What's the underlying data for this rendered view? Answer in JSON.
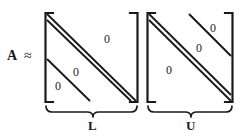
{
  "figure": {
    "background_color": "#ffffff",
    "ink_color": "#1a1a1a"
  },
  "equation": {
    "matrix_symbol": "A",
    "relation_symbol": "≈"
  },
  "matrices": [
    {
      "id": "L",
      "brace_label": "L",
      "kind": "lower-triangular",
      "zeros": [
        {
          "id": "zero-L-upper",
          "text": "0",
          "region": "upper-right"
        },
        {
          "id": "zero-L-mid",
          "text": "0",
          "region": "lower-left-inner"
        },
        {
          "id": "zero-L-lower",
          "text": "0",
          "region": "lower-left-outer"
        }
      ]
    },
    {
      "id": "U",
      "brace_label": "U",
      "kind": "upper-triangular",
      "zeros": [
        {
          "id": "zero-U-topright",
          "text": "0",
          "region": "upper-right-outer"
        },
        {
          "id": "zero-U-mid",
          "text": "0",
          "region": "upper-right-inner"
        },
        {
          "id": "zero-U-lower",
          "text": "0",
          "region": "lower-left"
        }
      ]
    }
  ],
  "zeros_text": {
    "L_upper": "0",
    "L_mid": "0",
    "L_lower": "0",
    "U_topright": "0",
    "U_mid": "0",
    "U_lower": "0"
  }
}
